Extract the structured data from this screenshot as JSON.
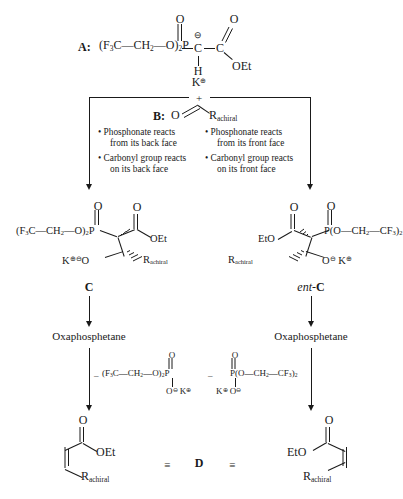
{
  "scheme": {
    "title": "Still-Gennari HWE reaction stereochemical scheme",
    "reagent_a": {
      "label": "A:",
      "formula_prefix": "(F",
      "text": "(F3C—CH2—O)2P—C—C",
      "parts": {
        "f3c": "F",
        "three": "3",
        "c1": "C",
        "dash1": "—",
        "ch2": "CH",
        "two_h": "2",
        "dash2": "—",
        "o": "O)",
        "two_o": "2",
        "p": "P",
        "bond": "—",
        "c_carbanion": "C",
        "minus": "⊖",
        "bond2": "—",
        "c_ester": "C",
        "top_o_p": "O",
        "top_o_c": "O",
        "h": "H",
        "oet": "OEt"
      },
      "counterion": "K",
      "counterion_charge": "⊕"
    },
    "plus_sign": "+",
    "reagent_b": {
      "label": "B:",
      "oxygen": "O",
      "r_group": "R",
      "r_sub": "achiral"
    },
    "branches": {
      "left": {
        "bullets": [
          "• Phosphonate reacts",
          "from its back face",
          "• Carbonyl group reacts",
          "on its back face"
        ]
      },
      "right": {
        "bullets": [
          "• Phosphonate reacts",
          "from its front face",
          "• Carbonyl group reacts",
          "on its front face"
        ]
      }
    },
    "intermediate_c": {
      "label": "C",
      "left_formula": "(F3C—CH2—O)2P",
      "f": "F",
      "f_sub": "3",
      "c": "C",
      "dash": "—",
      "ch": "CH",
      "ch_sub": "2",
      "o_paren": "O)",
      "o_sub": "2",
      "p": "P",
      "o_top": "O",
      "o_ester": "O",
      "oet": "OEt",
      "k": "K",
      "k_charge": "⊕",
      "o_minus": "O",
      "o_charge": "⊖",
      "r": "R",
      "r_sub": "achiral"
    },
    "intermediate_ent_c": {
      "label_italic": "ent",
      "label_dash": "-",
      "label_bold": "C",
      "eto": "EtO",
      "o_ester": "O",
      "p": "P",
      "o_top": "O",
      "o_paren": "(O",
      "dash": "—",
      "ch2": "CH",
      "ch2_sub": "2",
      "cf3": "CF",
      "cf3_sub": "3",
      "close_paren": ")",
      "close_sub": "2",
      "r": "R",
      "r_sub": "achiral",
      "o_minus": "O",
      "o_charge": "⊖",
      "k": "K",
      "k_charge": "⊕"
    },
    "oxaphosphetane_label": "Oxaphosphetane",
    "byproduct_left": {
      "minus": "–",
      "f": "F",
      "f_sub": "3",
      "c": "C",
      "dash": "—",
      "ch2": "CH",
      "ch2_sub": "2",
      "o_paren": "O)",
      "o_sub": "2",
      "p": "P",
      "o_top": "O",
      "o_bottom": "O",
      "o_charge": "⊖",
      "k": "K",
      "k_charge": "⊕"
    },
    "byproduct_right": {
      "minus": "–",
      "p": "P",
      "o_top": "O",
      "o_paren": "(O",
      "dash": "—",
      "ch2": "CH",
      "ch2_sub": "2",
      "cf3": "CF",
      "cf3_sub": "3",
      "close_paren": ")",
      "close_sub": "2",
      "k": "K",
      "k_charge": "⊕",
      "o_bottom": "O",
      "o_charge": "⊖"
    },
    "product": {
      "label": "D",
      "equiv_left": "≡",
      "equiv_right": "≡",
      "o": "O",
      "oet": "OEt",
      "eto": "EtO",
      "r": "R",
      "r_sub": "achiral"
    }
  }
}
